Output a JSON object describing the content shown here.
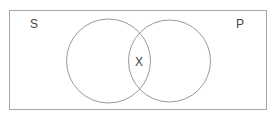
{
  "diagram": {
    "type": "venn",
    "labels": {
      "left_set": "S",
      "right_set": "P",
      "intersection": "X"
    },
    "colors": {
      "stroke": "#9a9a9a",
      "text": "#444444",
      "background": "#ffffff"
    }
  }
}
